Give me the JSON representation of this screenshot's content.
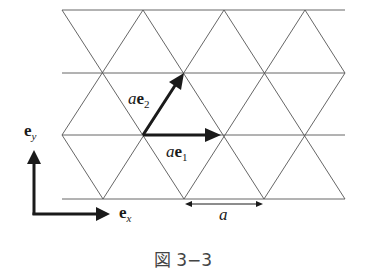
{
  "figure": {
    "caption": "図 3−3",
    "lattice": {
      "type": "triangular",
      "rows_y": [
        10,
        73,
        135,
        199
      ],
      "x_left": 62,
      "x_right": 345,
      "spacing_px": 81
    },
    "vectors": {
      "ae1": {
        "prefix": "a",
        "base": "e",
        "subscript": "1"
      },
      "ae2": {
        "prefix": "a",
        "base": "e",
        "subscript": "2"
      }
    },
    "axes": {
      "ex": {
        "base": "e",
        "subscript": "x"
      },
      "ey": {
        "base": "e",
        "subscript": "y"
      }
    },
    "dimension_label": "a",
    "colors": {
      "lines": "#555555",
      "arrows": "#1a1a1a",
      "caption": "#444444"
    }
  }
}
